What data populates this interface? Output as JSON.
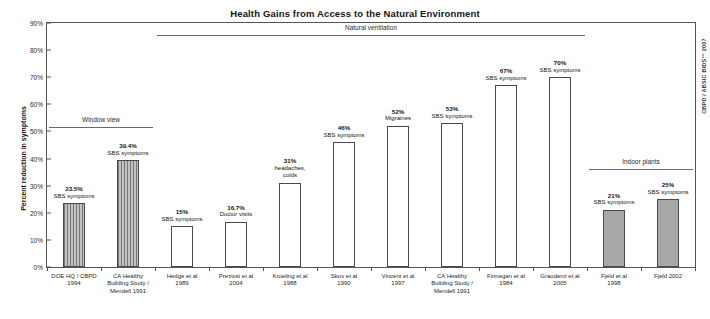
{
  "chart_data": {
    "type": "bar",
    "title": "Health Gains from Access to the Natural Environment",
    "xlabel": "",
    "ylabel": "Percent reduction in symptoms",
    "ylim": [
      0,
      90
    ],
    "ytick_labels": [
      "0%",
      "10%",
      "20%",
      "30%",
      "40%",
      "50%",
      "60%",
      "70%",
      "80%",
      "90%"
    ],
    "ytick_values": [
      0,
      10,
      20,
      30,
      40,
      50,
      60,
      70,
      80,
      90
    ],
    "grid": false,
    "legend": "none",
    "credit": "CBPD / ABSIC BIDS™ 2007",
    "categories": [
      "DOE HQ / CBPD 1994",
      "CA Healthy Building Study / Mendell 1991",
      "Hedge et al 1989",
      "Preziosi et al 2004",
      "Kroeling et al 1988",
      "Skov et al 1990",
      "Vincent et al 1997",
      "CA Healthy Building Study / Mendell 1991",
      "Finnegan et al 1984",
      "Graudenz et al 2005",
      "Fjeld et al 1998",
      "Fjeld 2002"
    ],
    "values": [
      23.5,
      39.4,
      15,
      16.7,
      31,
      46,
      52,
      53,
      67,
      70,
      21,
      25
    ],
    "bars": [
      {
        "value": 23.5,
        "value_label": "23.5%",
        "desc": "SBS symptoms",
        "category_lines": [
          "DOE HQ / CBPD",
          "1994"
        ],
        "style": "hatch"
      },
      {
        "value": 39.4,
        "value_label": "39.4%",
        "desc": "SBS symptoms",
        "category_lines": [
          "CA Healthy",
          "Building Study /",
          "Mendell 1991"
        ],
        "style": "hatch"
      },
      {
        "value": 15,
        "value_label": "15%",
        "desc": "SBS symptoms",
        "category_lines": [
          "Hedge et al",
          "1989"
        ],
        "style": "open"
      },
      {
        "value": 16.7,
        "value_label": "16.7%",
        "desc": "Doctor visits",
        "category_lines": [
          "Preziosi et al",
          "2004"
        ],
        "style": "open"
      },
      {
        "value": 31,
        "value_label": "31%",
        "desc": "headaches, colds",
        "category_lines": [
          "Kroeling et al",
          "1988"
        ],
        "style": "open"
      },
      {
        "value": 46,
        "value_label": "46%",
        "desc": "SBS symptoms",
        "category_lines": [
          "Skov et al",
          "1990"
        ],
        "style": "open"
      },
      {
        "value": 52,
        "value_label": "52%",
        "desc": "Migraines",
        "category_lines": [
          "Vincent et al",
          "1997"
        ],
        "style": "open"
      },
      {
        "value": 53,
        "value_label": "53%",
        "desc": "SBS symptoms",
        "category_lines": [
          "CA Healthy",
          "Building Study /",
          "Mendell 1991"
        ],
        "style": "open"
      },
      {
        "value": 67,
        "value_label": "67%",
        "desc": "SBS symptoms",
        "category_lines": [
          "Finnegan et al",
          "1984"
        ],
        "style": "open"
      },
      {
        "value": 70,
        "value_label": "70%",
        "desc": "SBS symptoms",
        "category_lines": [
          "Graudenz et al",
          "2005"
        ],
        "style": "open"
      },
      {
        "value": 21,
        "value_label": "21%",
        "desc": "SBS symptoms",
        "category_lines": [
          "Fjeld et al",
          "1998"
        ],
        "style": "solid"
      },
      {
        "value": 25,
        "value_label": "25%",
        "desc": "SBS symptoms",
        "category_lines": [
          "Fjeld 2002"
        ],
        "style": "solid"
      }
    ],
    "groups": [
      {
        "label": "Window view",
        "first_bar": 0,
        "last_bar": 1,
        "value_level": 51.5
      },
      {
        "label": "Natural ventilation",
        "first_bar": 2,
        "last_bar": 9,
        "value_level": 85.5
      },
      {
        "label": "Indoor plants",
        "first_bar": 10,
        "last_bar": 11,
        "value_level": 36.0
      }
    ]
  }
}
